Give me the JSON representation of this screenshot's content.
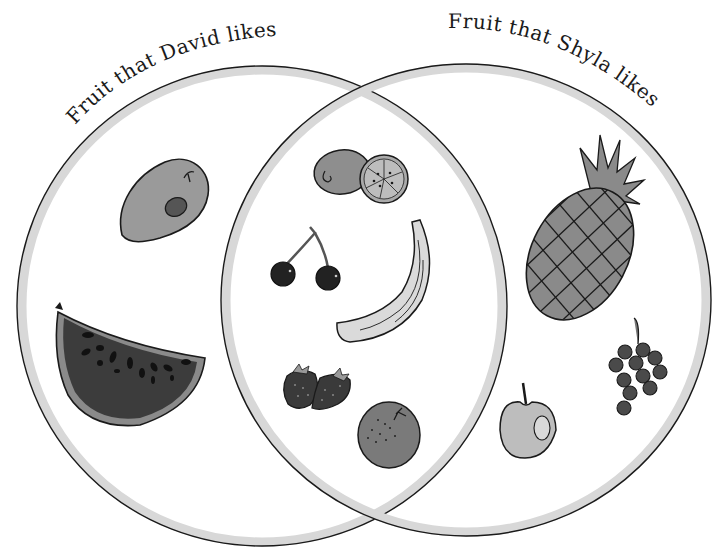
{
  "diagram": {
    "type": "venn",
    "sets": [
      {
        "id": "david",
        "label": "Fruit that David likes",
        "only_items": [
          "mango",
          "watermelon"
        ]
      },
      {
        "id": "shyla",
        "label": "Fruit that Shyla likes",
        "only_items": [
          "pineapple",
          "grapes",
          "apple"
        ]
      }
    ],
    "intersection": {
      "label": "Both",
      "items": [
        "kiwi",
        "cherries",
        "banana",
        "strawberries",
        "orange"
      ]
    }
  },
  "labels": {
    "left": "Fruit that David likes",
    "right": "Fruit that Shyla likes"
  },
  "colors": {
    "outline": "#1a1a1a",
    "ring": "#d6d6d6",
    "mango": "#9a9a9a",
    "watermelon_flesh": "#3c3c3c",
    "watermelon_rind": "#8a8a8a",
    "kiwi": "#8e8e8e",
    "cherries": "#222222",
    "banana": "#dadada",
    "strawberries": "#3a3a3a",
    "orange": "#7a7a7a",
    "pineapple": "#8a8a8a",
    "grapes": "#4a4a4a",
    "apple": "#bdbdbd"
  }
}
